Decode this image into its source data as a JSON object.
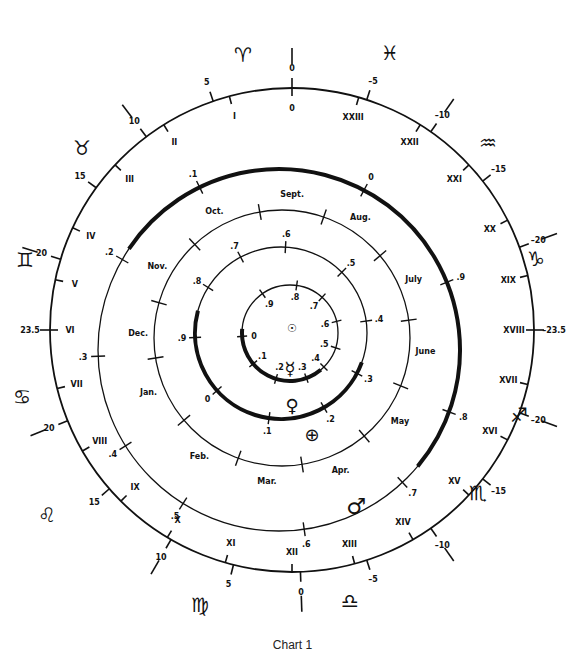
{
  "caption": "Chart 1",
  "geometry": {
    "outer": {
      "cx": 292,
      "cy": 330,
      "r": 242
    },
    "mars": {
      "cx": 279,
      "cy": 350,
      "r": 181
    },
    "earth": {
      "cx": 282,
      "cy": 338,
      "r": 128
    },
    "venus": {
      "cx": 281,
      "cy": 333,
      "r": 86
    },
    "mercury": {
      "cx": 290,
      "cy": 333,
      "r": 48
    },
    "sun": {
      "x": 292,
      "y": 328
    }
  },
  "outer_ring": {
    "declination_labels_outside": [
      {
        "text": "0",
        "angle": -90
      },
      {
        "text": "5",
        "angle": -109
      },
      {
        "text": "10",
        "angle": -127
      },
      {
        "text": "15",
        "angle": -144
      },
      {
        "text": "20",
        "angle": -163
      },
      {
        "text": "23.5",
        "angle": 180
      },
      {
        "text": "20",
        "angle": 158
      },
      {
        "text": "15",
        "angle": 139
      },
      {
        "text": "10",
        "angle": 120
      },
      {
        "text": "5",
        "angle": 104
      },
      {
        "text": "0",
        "angle": 88
      },
      {
        "text": "-5",
        "angle": 72
      },
      {
        "text": "-10",
        "angle": 55
      },
      {
        "text": "-15",
        "angle": 38
      },
      {
        "text": "-20",
        "angle": 20
      },
      {
        "text": "-23.5",
        "angle": 0
      },
      {
        "text": "-20",
        "angle": -20
      },
      {
        "text": "-15",
        "angle": -38
      },
      {
        "text": "-10",
        "angle": -55
      },
      {
        "text": "-5",
        "angle": -72
      }
    ],
    "hour_labels_inside": [
      {
        "text": "0",
        "angle": -90
      },
      {
        "text": "I",
        "angle": -105
      },
      {
        "text": "II",
        "angle": -122
      },
      {
        "text": "III",
        "angle": -137
      },
      {
        "text": "IV",
        "angle": -155
      },
      {
        "text": "V",
        "angle": -168
      },
      {
        "text": "VI",
        "angle": 180
      },
      {
        "text": "VII",
        "angle": 166
      },
      {
        "text": "VIII",
        "angle": 150
      },
      {
        "text": "IX",
        "angle": 135
      },
      {
        "text": "X",
        "angle": 121
      },
      {
        "text": "XI",
        "angle": 106
      },
      {
        "text": "XII",
        "angle": 90
      },
      {
        "text": "XIII",
        "angle": 75
      },
      {
        "text": "XIV",
        "angle": 60
      },
      {
        "text": "XV",
        "angle": 43
      },
      {
        "text": "XVI",
        "angle": 27
      },
      {
        "text": "XVII",
        "angle": 13
      },
      {
        "text": "XVIII",
        "angle": 0
      },
      {
        "text": "XIX",
        "angle": -13
      },
      {
        "text": "XX",
        "angle": -27
      },
      {
        "text": "XXI",
        "angle": -43
      },
      {
        "text": "XXII",
        "angle": -58
      },
      {
        "text": "XXIII",
        "angle": -74
      }
    ],
    "sign_divider_angles": [
      -90,
      -127,
      -163,
      158,
      120,
      88,
      55,
      20,
      -20,
      -55
    ]
  },
  "zodiac_signs": [
    {
      "name": "aries",
      "glyph": "♈",
      "x": 243,
      "y": 62
    },
    {
      "name": "pisces",
      "glyph": "♓",
      "x": 390,
      "y": 60
    },
    {
      "name": "taurus",
      "glyph": "♉",
      "x": 82,
      "y": 155
    },
    {
      "name": "aquarius",
      "glyph": "♒",
      "x": 488,
      "y": 150
    },
    {
      "name": "gemini",
      "glyph": "♊",
      "x": 25,
      "y": 267
    },
    {
      "name": "capricorn",
      "glyph": "♑",
      "x": 536,
      "y": 266
    },
    {
      "name": "cancer",
      "glyph": "♋",
      "x": 22,
      "y": 404
    },
    {
      "name": "sagittarius",
      "glyph": "♐",
      "x": 519,
      "y": 422
    },
    {
      "name": "leo",
      "glyph": "♌",
      "x": 47,
      "y": 522
    },
    {
      "name": "scorpio",
      "glyph": "♏",
      "x": 478,
      "y": 500
    },
    {
      "name": "virgo",
      "glyph": "♍",
      "x": 200,
      "y": 612
    },
    {
      "name": "libra",
      "glyph": "♎",
      "x": 350,
      "y": 608
    }
  ],
  "mars_orbit": {
    "symbol": "♂",
    "symbol_pos": {
      "x": 356,
      "y": 514
    },
    "labels": [
      {
        "text": ".1",
        "angle": -116
      },
      {
        "text": "0",
        "angle": -62
      },
      {
        "text": ".9",
        "angle": -22
      },
      {
        "text": ".8",
        "angle": 20
      },
      {
        "text": ".7",
        "angle": 47
      },
      {
        "text": ".6",
        "angle": 82
      },
      {
        "text": ".5",
        "angle": 122
      },
      {
        "text": ".4",
        "angle": 148
      },
      {
        "text": ".3",
        "angle": 178
      },
      {
        "text": ".2",
        "angle": -150
      }
    ],
    "heavy_arc": {
      "from": -146,
      "to": 40
    }
  },
  "earth_orbit": {
    "symbol": "⊕",
    "symbol_pos": {
      "x": 312,
      "y": 441
    },
    "months": [
      {
        "text": "Sept.",
        "angle": -86
      },
      {
        "text": "Aug.",
        "angle": -57
      },
      {
        "text": "July",
        "angle": -24
      },
      {
        "text": "June",
        "angle": 5
      },
      {
        "text": "May",
        "angle": 35
      },
      {
        "text": "Apr.",
        "angle": 66
      },
      {
        "text": "Mar.",
        "angle": 96
      },
      {
        "text": "Feb.",
        "angle": 125
      },
      {
        "text": "Jan.",
        "angle": 158
      },
      {
        "text": "Dec.",
        "angle": -178
      },
      {
        "text": "Nov.",
        "angle": -150
      },
      {
        "text": "Oct.",
        "angle": -118
      }
    ],
    "tick_angles": [
      -100,
      -71,
      -40,
      -8,
      22,
      50,
      81,
      110,
      140,
      171,
      -164,
      -133
    ]
  },
  "venus_orbit": {
    "symbol": "♀",
    "symbol_pos": {
      "x": 292,
      "y": 412
    },
    "labels": [
      {
        "text": ".6",
        "angle": -87
      },
      {
        "text": ".5",
        "angle": -45
      },
      {
        "text": ".4",
        "angle": -8
      },
      {
        "text": ".3",
        "angle": 28
      },
      {
        "text": ".2",
        "angle": 60
      },
      {
        "text": ".1",
        "angle": 98
      },
      {
        "text": "0",
        "angle": 138
      },
      {
        "text": ".9",
        "angle": 177
      },
      {
        "text": ".8",
        "angle": -148
      },
      {
        "text": ".7",
        "angle": -118
      }
    ],
    "heavy_arc": {
      "from": 20,
      "to": 195
    }
  },
  "mercury_orbit": {
    "symbol": "☿",
    "symbol_pos": {
      "x": 290,
      "y": 375
    },
    "labels": [
      {
        "text": ".8",
        "angle": -82
      },
      {
        "text": ".7",
        "angle": -48
      },
      {
        "text": ".6",
        "angle": -14
      },
      {
        "text": ".5",
        "angle": 18
      },
      {
        "text": ".4",
        "angle": 45
      },
      {
        "text": ".3",
        "angle": 70
      },
      {
        "text": ".2",
        "angle": 107
      },
      {
        "text": ".1",
        "angle": 140
      },
      {
        "text": "0",
        "angle": 176
      },
      {
        "text": ".9",
        "angle": -125
      }
    ],
    "heavy_arc": {
      "from": 50,
      "to": 185
    }
  },
  "sun": {
    "symbol": "☉"
  }
}
